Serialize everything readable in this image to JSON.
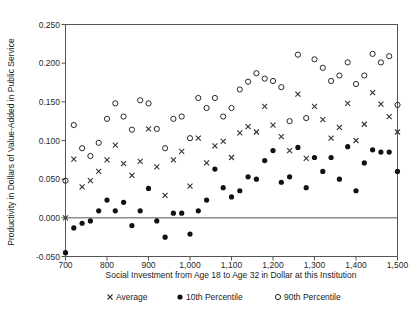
{
  "chart_data": {
    "type": "scatter",
    "title": "",
    "xlabel": "Social Investment from Age 18 to Age 32 in Dollar at this Institution",
    "ylabel": "Productivity in Dollars of Value-Added in Public Service",
    "xlim": [
      700,
      1500
    ],
    "ylim": [
      -0.05,
      0.25
    ],
    "xticks": [
      700,
      800,
      900,
      1000,
      1100,
      1200,
      1300,
      1400,
      1500
    ],
    "xticklabels": [
      "700",
      "800",
      "900",
      "1,000",
      "1,100",
      "1,200",
      "1,300",
      "1,400",
      "1,500"
    ],
    "yticks": [
      -0.05,
      0.0,
      0.05,
      0.1,
      0.15,
      0.2,
      0.25
    ],
    "yticklabels": [
      "-0.050",
      "0.000",
      "0.050",
      "0.100",
      "0.150",
      "0.200",
      "0.250"
    ],
    "grid": false,
    "legend_position": "bottom",
    "zero_reference_line": 0.0,
    "x": [
      700,
      720,
      740,
      760,
      780,
      800,
      820,
      840,
      860,
      880,
      900,
      920,
      940,
      960,
      980,
      1000,
      1020,
      1040,
      1060,
      1080,
      1100,
      1120,
      1140,
      1160,
      1180,
      1200,
      1220,
      1240,
      1260,
      1280,
      1300,
      1320,
      1340,
      1360,
      1380,
      1400,
      1420,
      1440,
      1460,
      1480,
      1500
    ],
    "series": [
      {
        "name": "Average",
        "marker": "x",
        "values": [
          0.0,
          0.076,
          0.04,
          0.048,
          0.06,
          0.075,
          0.094,
          0.07,
          0.055,
          0.073,
          0.115,
          0.066,
          0.029,
          0.075,
          0.086,
          0.041,
          0.103,
          0.071,
          0.093,
          0.099,
          0.078,
          0.11,
          0.118,
          0.111,
          0.144,
          0.12,
          0.105,
          0.087,
          0.16,
          0.077,
          0.144,
          0.127,
          0.103,
          0.117,
          0.148,
          0.1,
          0.121,
          0.162,
          0.147,
          0.131,
          0.111
        ]
      },
      {
        "name": "10th Percentile",
        "marker": "filled-circle",
        "values": [
          -0.045,
          -0.013,
          -0.007,
          -0.004,
          0.009,
          0.023,
          0.009,
          0.02,
          -0.01,
          0.009,
          0.038,
          -0.004,
          -0.025,
          0.006,
          0.006,
          -0.021,
          0.009,
          0.023,
          0.063,
          0.039,
          0.027,
          0.035,
          0.053,
          0.05,
          0.074,
          0.087,
          0.046,
          0.053,
          0.091,
          0.039,
          0.078,
          0.06,
          0.078,
          0.05,
          0.092,
          0.035,
          0.071,
          0.088,
          0.085,
          0.085,
          0.06
        ]
      },
      {
        "name": "90th Percentile",
        "marker": "open-circle",
        "values": [
          0.048,
          0.12,
          0.09,
          0.08,
          0.097,
          0.128,
          0.148,
          0.131,
          0.114,
          0.152,
          0.148,
          0.115,
          0.09,
          0.128,
          0.131,
          0.103,
          0.155,
          0.142,
          0.155,
          0.131,
          0.142,
          0.166,
          0.176,
          0.187,
          0.18,
          0.177,
          0.169,
          0.125,
          0.211,
          0.129,
          0.205,
          0.194,
          0.177,
          0.184,
          0.201,
          0.173,
          0.184,
          0.212,
          0.201,
          0.209,
          0.146
        ]
      }
    ],
    "legend": [
      {
        "label": "Average",
        "marker": "x"
      },
      {
        "label": "10th Percentile",
        "marker": "filled-circle"
      },
      {
        "label": "90th Percentile",
        "marker": "open-circle"
      }
    ]
  }
}
